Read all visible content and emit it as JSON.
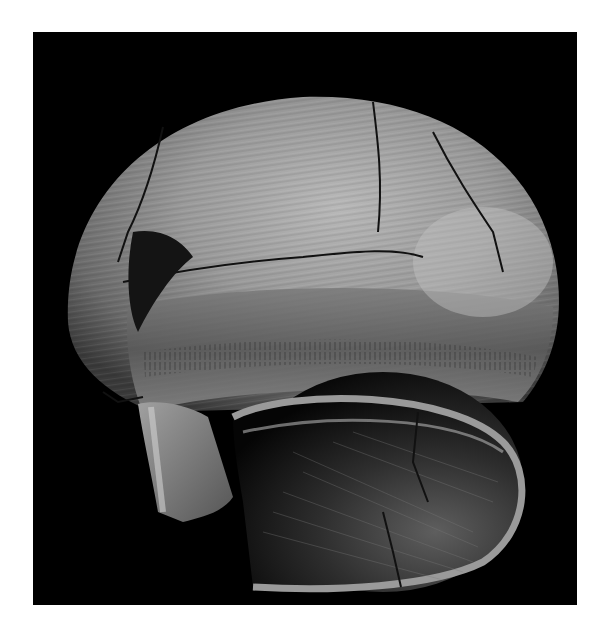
{
  "image": {
    "subject": "Ancient coiled pottery vessel, broken and reassembled, viewed from below with rim opening",
    "alt": "Black-and-white photograph of a fragmented spherical clay pot with striated surface on a black background",
    "background_color": "#000000",
    "page_color": "#ffffff",
    "vessel_colors": {
      "light": "#c9c9c9",
      "mid": "#8a8a8a",
      "dark": "#4a4a4a",
      "shadow": "#1a1a1a"
    }
  }
}
